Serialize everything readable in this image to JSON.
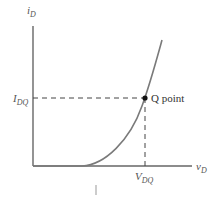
{
  "diagram": {
    "type": "mosfet-transfer-characteristic",
    "y_axis": {
      "label_main": "i",
      "label_sub": "D"
    },
    "x_axis": {
      "label_main": "v",
      "label_sub": "D"
    },
    "operating_point": {
      "label": "Q point",
      "y_level": {
        "label_main": "I",
        "label_sub": "DQ"
      },
      "x_level": {
        "label_main": "V",
        "label_sub": "DQ"
      }
    },
    "colors": {
      "axis": "#666666",
      "curve": "#7a7a7a",
      "dashed": "#444444",
      "point": "#111111",
      "text": "#555555"
    }
  }
}
